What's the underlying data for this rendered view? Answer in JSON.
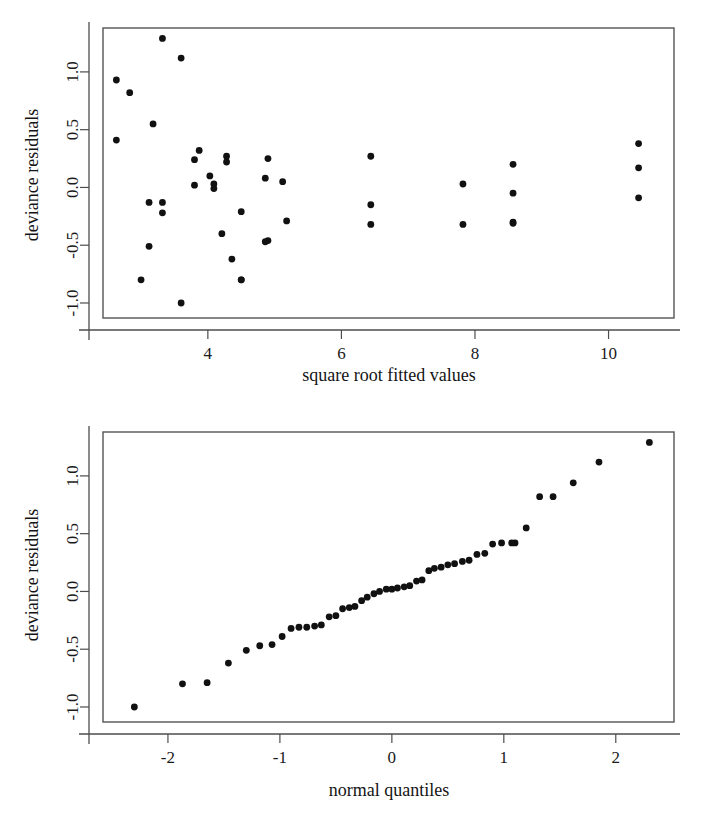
{
  "figure": {
    "background_color": "#ffffff",
    "point_color": "#111111",
    "axis_color": "#4d4d4d"
  },
  "chart_data": [
    {
      "id": "residuals-vs-fitted",
      "type": "scatter",
      "title": "",
      "xlabel": "square root fitted values",
      "ylabel": "deviance residuals",
      "xlim": [
        2.43,
        10.98
      ],
      "ylim": [
        -1.13,
        1.38
      ],
      "xticks": [
        4,
        6,
        8,
        10
      ],
      "xticklabels": [
        "4",
        "6",
        "8",
        "10"
      ],
      "yticks": [
        1.0,
        0.5,
        0.0,
        -0.5,
        -1.0
      ],
      "yticklabels": [
        "1.0",
        "0.5",
        "0.0",
        "-0.5",
        "-1.0"
      ],
      "grid": false,
      "legend": "none",
      "x": [
        3.32,
        3.6,
        2.63,
        2.83,
        3.18,
        2.63,
        3.87,
        4.28,
        4.28,
        4.9,
        6.44,
        8.57,
        3.8,
        4.03,
        4.09,
        4.09,
        3.8,
        4.86,
        5.12,
        8.57,
        10.45,
        10.45,
        7.82,
        3.12,
        3.32,
        3.32,
        4.5,
        6.44,
        8.57,
        10.45,
        4.9,
        5.18,
        6.44,
        7.82,
        8.57,
        3.12,
        4.21,
        4.5,
        4.86,
        4.36,
        3.0,
        4.5,
        3.6
      ],
      "y": [
        1.29,
        1.12,
        0.93,
        0.82,
        0.55,
        0.41,
        0.32,
        0.27,
        0.22,
        0.25,
        0.27,
        0.2,
        0.24,
        0.1,
        0.03,
        -0.01,
        0.02,
        0.08,
        0.05,
        -0.05,
        0.38,
        0.17,
        0.03,
        -0.13,
        -0.13,
        -0.22,
        -0.21,
        -0.15,
        -0.3,
        -0.09,
        -0.46,
        -0.29,
        -0.32,
        -0.32,
        -0.31,
        -0.51,
        -0.4,
        -0.8,
        -0.47,
        -0.62,
        -0.8,
        -0.8,
        -1.0
      ]
    },
    {
      "id": "normal-qq-plot",
      "type": "scatter",
      "title": "",
      "xlabel": "normal quantiles",
      "ylabel": "deviance residuals",
      "xlim": [
        -2.58,
        2.52
      ],
      "ylim": [
        -1.13,
        1.38
      ],
      "xticks": [
        -2,
        -1,
        0,
        1,
        2
      ],
      "xticklabels": [
        "-2",
        "-1",
        "0",
        "1",
        "2"
      ],
      "yticks": [
        1.0,
        0.5,
        0.0,
        -0.5,
        -1.0
      ],
      "yticklabels": [
        "1.0",
        "0.5",
        "0.0",
        "-0.5",
        "-1.0"
      ],
      "grid": false,
      "legend": "none",
      "x": [
        -2.3,
        -1.87,
        -1.65,
        -1.46,
        -1.3,
        -1.18,
        -1.07,
        -0.98,
        -0.9,
        -0.83,
        -0.76,
        -0.69,
        -0.63,
        -0.56,
        -0.5,
        -0.44,
        -0.38,
        -0.33,
        -0.27,
        -0.22,
        -0.16,
        -0.11,
        -0.05,
        0.0,
        0.05,
        0.11,
        0.16,
        0.22,
        0.27,
        0.33,
        0.38,
        0.44,
        0.5,
        0.56,
        0.63,
        0.69,
        0.76,
        0.83,
        0.9,
        0.98,
        1.07,
        1.1,
        1.2,
        1.32,
        1.44,
        1.62,
        1.85,
        2.3
      ],
      "y": [
        -1.0,
        -0.8,
        -0.79,
        -0.62,
        -0.51,
        -0.47,
        -0.46,
        -0.39,
        -0.32,
        -0.31,
        -0.31,
        -0.3,
        -0.29,
        -0.22,
        -0.21,
        -0.15,
        -0.14,
        -0.13,
        -0.08,
        -0.05,
        -0.02,
        0.0,
        0.02,
        0.02,
        0.03,
        0.04,
        0.05,
        0.09,
        0.1,
        0.18,
        0.2,
        0.21,
        0.23,
        0.24,
        0.26,
        0.27,
        0.32,
        0.33,
        0.41,
        0.42,
        0.42,
        0.42,
        0.55,
        0.82,
        0.82,
        0.94,
        1.12,
        1.29
      ]
    }
  ]
}
